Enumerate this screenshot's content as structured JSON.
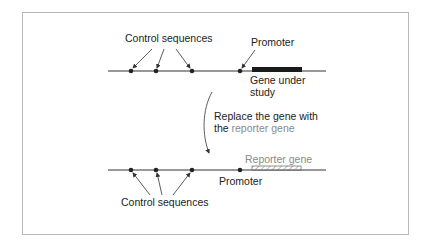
{
  "top_construct": {
    "control_label": "Control sequences",
    "promoter_label": "Promoter",
    "gene_label_line1": "Gene under",
    "gene_label_line2": "study"
  },
  "transition": {
    "line1": "Replace the gene with",
    "line2_prefix": "the ",
    "line2_highlight": "reporter gene"
  },
  "bottom_construct": {
    "reporter_label": "Reporter gene",
    "promoter_label": "Promoter",
    "control_label": "Control sequences"
  },
  "colors": {
    "line": "#333333",
    "gene_bar": "#1a1a1a",
    "reporter": "#8a8a8a",
    "frame": "#b8b8b8"
  }
}
